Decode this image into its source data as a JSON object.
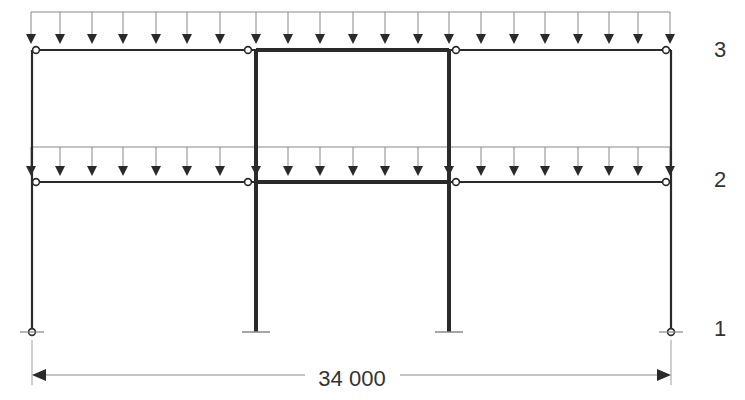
{
  "diagram": {
    "type": "structural-frame",
    "levels": [
      {
        "id": "level-1",
        "label": "1",
        "y": 332
      },
      {
        "id": "level-2",
        "label": "2",
        "y": 182
      },
      {
        "id": "level-3",
        "label": "3",
        "y": 50
      }
    ],
    "columns": [
      {
        "id": "col-left",
        "x": 32,
        "weight": "thin",
        "base": "pinned"
      },
      {
        "id": "col-inner-left",
        "x": 256,
        "weight": "thick",
        "base": "fixed"
      },
      {
        "id": "col-inner-right",
        "x": 449,
        "weight": "thick",
        "base": "fixed"
      },
      {
        "id": "col-right",
        "x": 671,
        "weight": "thin",
        "base": "pinned"
      }
    ],
    "beams": [
      {
        "id": "beam-3-left",
        "level": "3",
        "from": 32,
        "to": 256,
        "weight": "thin"
      },
      {
        "id": "beam-3-center",
        "level": "3",
        "from": 256,
        "to": 449,
        "weight": "thick"
      },
      {
        "id": "beam-3-right",
        "level": "3",
        "from": 449,
        "to": 671,
        "weight": "thin"
      },
      {
        "id": "beam-2-left",
        "level": "2",
        "from": 32,
        "to": 256,
        "weight": "thin"
      },
      {
        "id": "beam-2-center",
        "level": "2",
        "from": 256,
        "to": 449,
        "weight": "thick"
      },
      {
        "id": "beam-2-right",
        "level": "2",
        "from": 449,
        "to": 671,
        "weight": "thin"
      }
    ],
    "hinges": [
      {
        "x": 36,
        "y": 50
      },
      {
        "x": 248,
        "y": 50
      },
      {
        "x": 456,
        "y": 50
      },
      {
        "x": 666,
        "y": 50
      },
      {
        "x": 36,
        "y": 182
      },
      {
        "x": 248,
        "y": 182
      },
      {
        "x": 456,
        "y": 182
      },
      {
        "x": 666,
        "y": 182
      },
      {
        "x": 32,
        "y": 332
      },
      {
        "x": 671,
        "y": 332
      }
    ],
    "distributed_loads": [
      {
        "level": "3",
        "line_y": 12,
        "arrow_tip_y": 44,
        "arrow_x": [
          31,
          60,
          92,
          123,
          156,
          187,
          220,
          256,
          288,
          320,
          353,
          385,
          418,
          449,
          481,
          514,
          545,
          578,
          609,
          638,
          670
        ]
      },
      {
        "level": "2",
        "line_y": 147,
        "arrow_tip_y": 176,
        "arrow_x": [
          31,
          60,
          92,
          123,
          156,
          187,
          220,
          256,
          288,
          320,
          353,
          385,
          418,
          449,
          481,
          514,
          545,
          578,
          609,
          638,
          670
        ]
      }
    ],
    "dimension": {
      "text": "34 000",
      "from_x": 32,
      "to_x": 671,
      "y": 375
    },
    "level_labels": {
      "l3": "3",
      "l2": "2",
      "l1": "1"
    },
    "colors": {
      "stroke": "#2a2a2a",
      "thin_line": "#888888",
      "text": "#333333"
    }
  }
}
